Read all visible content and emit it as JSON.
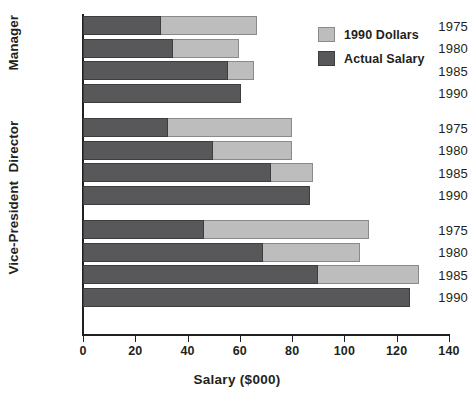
{
  "chart_data": {
    "type": "bar",
    "orientation": "horizontal",
    "stacked": true,
    "title": "",
    "xlabel": "Salary ($000)",
    "ylabel": "",
    "xlim": [
      0,
      140
    ],
    "xticks": [
      0,
      20,
      40,
      60,
      80,
      100,
      120,
      140
    ],
    "xtick_labels": [
      "0",
      "20",
      "40",
      "60",
      "80",
      "100",
      "120",
      "140"
    ],
    "grid": false,
    "legend_position": "top-right",
    "legend": [
      "1990 Dollars",
      "Actual Salary"
    ],
    "colors": {
      "actual_salary": "#58585a",
      "dollars_1990": "#bdbdbd",
      "axis": "#231f20",
      "background": "#ffffff"
    },
    "groups": [
      {
        "label": "Manager",
        "categories": [
          "1975",
          "1980",
          "1985",
          "1990"
        ],
        "series": [
          {
            "name": "Actual Salary",
            "values": [
              30.0,
              34.5,
              55.5,
              60.3
            ]
          },
          {
            "name": "1990 Dollars",
            "values": [
              66.4,
              59.8,
              65.4,
              60.3
            ]
          }
        ]
      },
      {
        "label": "Director",
        "categories": [
          "1975",
          "1980",
          "1985",
          "1990"
        ],
        "series": [
          {
            "name": "Actual Salary",
            "values": [
              32.5,
              49.7,
              72.0,
              86.8
            ]
          },
          {
            "name": "1990 Dollars",
            "values": [
              80.1,
              79.8,
              88.1,
              86.8
            ]
          }
        ]
      },
      {
        "label": "Vice-President",
        "categories": [
          "1975",
          "1980",
          "1985",
          "1990"
        ],
        "series": [
          {
            "name": "Actual Salary",
            "values": [
              46.3,
              68.7,
              90.0,
              125.1
            ]
          },
          {
            "name": "1990 Dollars",
            "values": [
              109.4,
              106.0,
              128.5,
              125.1
            ]
          }
        ]
      }
    ]
  }
}
